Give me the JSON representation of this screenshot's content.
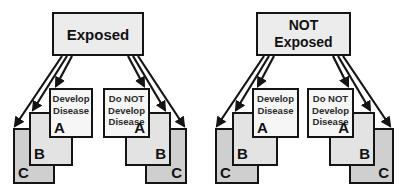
{
  "groups": [
    {
      "header": "Exposed",
      "develop": {
        "text": "Develop Disease",
        "cards": [
          "A",
          "B",
          "C"
        ]
      },
      "not_develop": {
        "text": "Do NOT Develop Disease",
        "cards": [
          "A",
          "B",
          "C"
        ]
      }
    },
    {
      "header": "NOT Exposed",
      "develop": {
        "text": "Develop Disease",
        "cards": [
          "A",
          "B",
          "C"
        ]
      },
      "not_develop": {
        "text": "Do NOT Develop Disease",
        "cards": [
          "A",
          "B",
          "C"
        ]
      }
    }
  ],
  "colors": {
    "header_fill": "#ececec",
    "card_a_fill": "#f6f6f6",
    "card_b_fill": "#e3e3e3",
    "card_c_fill": "#cfcfcf",
    "stroke": "#141414"
  }
}
